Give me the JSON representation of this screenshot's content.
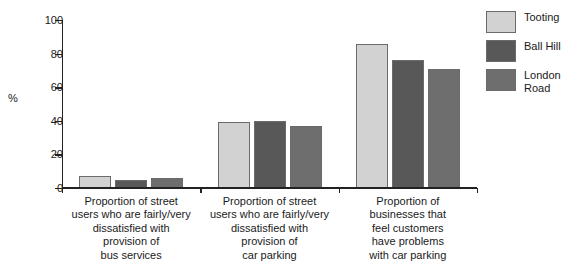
{
  "chart_data": {
    "type": "bar",
    "title": "",
    "xlabel": "",
    "ylabel": "%",
    "ylim": [
      0,
      100
    ],
    "yticks": [
      0,
      20,
      40,
      60,
      80,
      100
    ],
    "grid": false,
    "legend_position": "right",
    "categories": [
      "Proportion of street\nusers who are fairly/very\ndissatisfied with\nprovision of\nbus services",
      "Proportion of street\nusers who are fairly/very\ndissatisfied with\nprovision of\ncar parking",
      "Proportion of\nbusinesses that\nfeel customers\nhave problems\nwith car parking"
    ],
    "series": [
      {
        "name": "Tooting",
        "color": "#d2d2d2",
        "values": [
          7,
          39,
          86
        ]
      },
      {
        "name": "Ball Hill",
        "color": "#585858",
        "values": [
          5,
          40,
          76
        ]
      },
      {
        "name": "London\nRoad",
        "color": "#6e6e6e",
        "values": [
          6,
          37,
          71
        ]
      }
    ]
  },
  "axis": {
    "y_title": "%",
    "y_tick_labels": [
      "0",
      "20",
      "40",
      "60",
      "80",
      "100"
    ]
  },
  "legend": {
    "entries": [
      {
        "label": "Tooting"
      },
      {
        "label": "Ball Hill"
      },
      {
        "label": "London\nRoad"
      }
    ]
  }
}
